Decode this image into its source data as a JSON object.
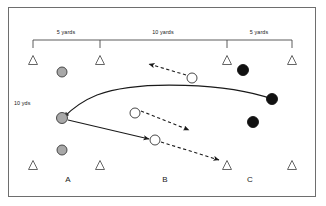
{
  "diagram": {
    "frame": {
      "border_color": "#6e6e6e",
      "background": "#ffffff"
    },
    "dimension_labels": [
      {
        "text": "5 yards",
        "x": 66,
        "y": 30
      },
      {
        "text": "10 yards",
        "x": 163,
        "y": 30
      },
      {
        "text": "5 yards",
        "x": 259,
        "y": 30
      }
    ],
    "side_label": {
      "text": "10 yds",
      "x": 14,
      "y": 101
    },
    "group_labels": [
      {
        "text": "A",
        "x": 68,
        "y": 176
      },
      {
        "text": "B",
        "x": 165,
        "y": 176
      },
      {
        "text": "C",
        "x": 250,
        "y": 176
      }
    ],
    "bracket": {
      "y": 40,
      "tick_height": 8,
      "ticks": [
        33,
        100,
        227,
        292
      ],
      "color": "#4a4a4a"
    },
    "cones_top": [
      {
        "x": 33,
        "y": 60
      },
      {
        "x": 100,
        "y": 60
      },
      {
        "x": 227,
        "y": 60
      },
      {
        "x": 292,
        "y": 60
      }
    ],
    "cones_bottom": [
      {
        "x": 33,
        "y": 165
      },
      {
        "x": 100,
        "y": 165
      },
      {
        "x": 227,
        "y": 165
      },
      {
        "x": 292,
        "y": 165
      }
    ],
    "cone_style": {
      "fill": "#ffffff",
      "stroke": "#555555",
      "size": 9
    },
    "players_gray": [
      {
        "x": 62,
        "y": 72,
        "r": 5
      },
      {
        "x": 62,
        "y": 118,
        "r": 5.5
      },
      {
        "x": 62,
        "y": 150,
        "r": 5
      }
    ],
    "players_gray_style": {
      "fill": "#a8a8a8",
      "stroke": "#3a3a3a"
    },
    "players_black": [
      {
        "x": 243,
        "y": 70,
        "r": 5.5
      },
      {
        "x": 272,
        "y": 99,
        "r": 5.5
      },
      {
        "x": 253,
        "y": 122,
        "r": 5.5
      }
    ],
    "players_black_style": {
      "fill": "#111111",
      "stroke": "#111111"
    },
    "players_white": [
      {
        "x": 192,
        "y": 78,
        "r": 5
      },
      {
        "x": 135,
        "y": 113,
        "r": 5
      },
      {
        "x": 155,
        "y": 140,
        "r": 5
      }
    ],
    "players_white_style": {
      "fill": "#ffffff",
      "stroke": "#333333"
    },
    "solid_paths": [
      {
        "name": "curved-pass-path",
        "d": "M 272 99 C 230 84, 140 79, 97 95 C 82 101, 70 111, 64 117",
        "arrow_end": true
      },
      {
        "name": "run-path",
        "d": "M 68 120 L 149 139",
        "arrow_end": true
      }
    ],
    "dashed_paths": [
      {
        "name": "route-upper-left",
        "d": "M 186 75 L 149 64",
        "arrow_end": true
      },
      {
        "name": "route-middle-down-right",
        "d": "M 141 111 L 189 130",
        "arrow_end": true
      },
      {
        "name": "route-lower-right",
        "d": "M 161 142 L 219 160",
        "arrow_end": true
      }
    ],
    "colors": {
      "line": "#1a1a1a",
      "bracket": "#4a4a4a",
      "text": "#1a1a1a"
    }
  }
}
